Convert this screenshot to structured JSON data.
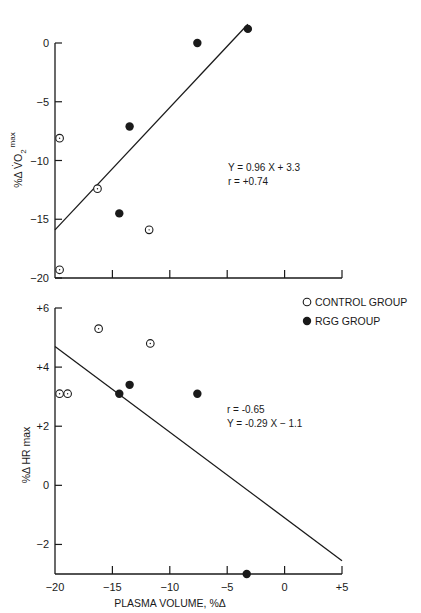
{
  "chart_data": [
    {
      "type": "scatter",
      "id": "vo2",
      "title": "",
      "xlabel": "",
      "ylabel": "%Δ V̇O2 max",
      "ylabel_parts": {
        "prefix": "%Δ V̇O",
        "sub": "2",
        "sup": "max"
      },
      "xlim": [
        -20,
        5
      ],
      "ylim": [
        -20,
        2
      ],
      "x_ticks": [
        -20,
        -15,
        -10,
        -5,
        0,
        5
      ],
      "x_tick_labels_shown": false,
      "y_ticks": [
        0,
        -5,
        -10,
        -15,
        -20
      ],
      "y_tick_labels": [
        "0",
        "-5",
        "-10",
        "-15",
        "-20"
      ],
      "grid": false,
      "series": [
        {
          "name": "CONTROL GROUP",
          "marker": "open-circle",
          "points": [
            [
              -19.6,
              -8.1
            ],
            [
              -16.3,
              -12.4
            ],
            [
              -11.8,
              -15.9
            ],
            [
              -19.6,
              -19.3
            ]
          ]
        },
        {
          "name": "RGG GROUP",
          "marker": "filled-circle",
          "points": [
            [
              -7.6,
              0.0
            ],
            [
              -3.2,
              1.2
            ],
            [
              -13.5,
              -7.1
            ],
            [
              -14.4,
              -14.5
            ]
          ]
        }
      ],
      "regression": {
        "slope": 0.96,
        "intercept": 3.3,
        "x_range": [
          -20,
          -3.2
        ]
      },
      "annotations": [
        "Y = 0.96 X + 3.3",
        "r = +0.74"
      ]
    },
    {
      "type": "scatter",
      "id": "hr",
      "title": "",
      "xlabel": "PLASMA VOLUME, %Δ",
      "ylabel": "%Δ HR max",
      "xlim": [
        -20,
        5
      ],
      "ylim": [
        -3,
        6
      ],
      "x_ticks": [
        -20,
        -15,
        -10,
        -5,
        0,
        5
      ],
      "x_tick_labels": [
        "-20",
        "-15",
        "-10",
        "-5",
        "0",
        "+5"
      ],
      "y_ticks": [
        6,
        4,
        2,
        0,
        -2
      ],
      "y_tick_labels": [
        "+6",
        "+4",
        "+2",
        "0",
        "-2"
      ],
      "grid": false,
      "legend_position": "upper right",
      "series": [
        {
          "name": "CONTROL GROUP",
          "marker": "open-circle",
          "points": [
            [
              -19.6,
              3.1
            ],
            [
              -18.9,
              3.1
            ],
            [
              -16.2,
              5.3
            ],
            [
              -11.7,
              4.8
            ]
          ]
        },
        {
          "name": "RGG GROUP",
          "marker": "filled-circle",
          "points": [
            [
              -14.4,
              3.1
            ],
            [
              -13.5,
              3.4
            ],
            [
              -7.6,
              3.1
            ],
            [
              -3.3,
              -3.0
            ]
          ]
        }
      ],
      "regression": {
        "slope": -0.29,
        "intercept": -1.1,
        "x_range": [
          -20,
          5
        ]
      },
      "annotations": [
        "r = -0.65",
        "Y = -0.29 X - 1.1"
      ]
    }
  ],
  "legend": {
    "items": [
      {
        "label": "CONTROL GROUP",
        "marker": "open-circle"
      },
      {
        "label": "RGG GROUP",
        "marker": "filled-circle"
      }
    ]
  },
  "colors": {
    "ink": "#1a1a1a",
    "background": "#ffffff"
  }
}
